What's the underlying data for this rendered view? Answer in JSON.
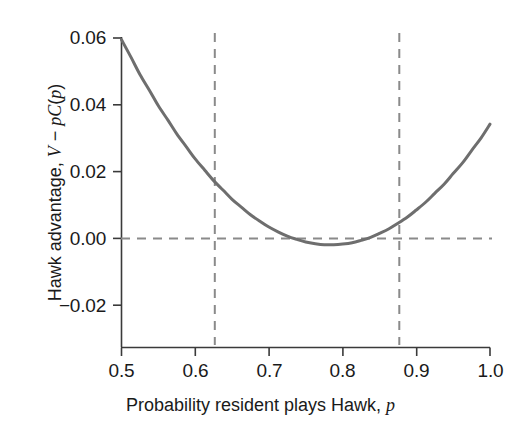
{
  "chart_data": {
    "type": "line",
    "title": "",
    "xlabel": "Probability resident plays Hawk, p",
    "ylabel": "Hawk advantage, V − pC(p)",
    "xlim": [
      0.5,
      1.0
    ],
    "ylim": [
      -0.0326,
      0.0606
    ],
    "grid": false,
    "legend": null,
    "xticks": [
      0.5,
      0.6,
      0.7,
      0.8,
      0.9,
      1.0
    ],
    "xticklabels": [
      "0.5",
      "0.6",
      "0.7",
      "0.8",
      "0.9",
      "1.0"
    ],
    "yticks": [
      -0.02,
      0.0,
      0.02,
      0.04,
      0.06
    ],
    "yticklabels": [
      "−0.02",
      "0.00",
      "0.02",
      "0.04",
      "0.06"
    ],
    "series": [
      {
        "name": "Hawk advantage",
        "color": "#6e6e6e",
        "linewidth": 3,
        "x": [
          0.5,
          0.513,
          0.525,
          0.538,
          0.55,
          0.563,
          0.575,
          0.588,
          0.6,
          0.613,
          0.625,
          0.638,
          0.65,
          0.663,
          0.675,
          0.688,
          0.7,
          0.713,
          0.725,
          0.738,
          0.75,
          0.763,
          0.775,
          0.788,
          0.8,
          0.813,
          0.825,
          0.838,
          0.85,
          0.863,
          0.875,
          0.888,
          0.9,
          0.913,
          0.925,
          0.938,
          0.95,
          0.963,
          0.975,
          0.988,
          1.0
        ],
        "y": [
          0.0595,
          0.0542,
          0.0491,
          0.0443,
          0.0397,
          0.0354,
          0.0313,
          0.0274,
          0.0238,
          0.0204,
          0.0173,
          0.0144,
          0.0117,
          0.0093,
          0.0071,
          0.0051,
          0.0034,
          0.0019,
          0.0007,
          -0.0003,
          -0.0011,
          -0.0016,
          -0.0019,
          -0.0019,
          -0.0017,
          -0.0013,
          -0.0006,
          0.0003,
          0.0015,
          0.0029,
          0.0045,
          0.0064,
          0.0085,
          0.0109,
          0.0135,
          0.0163,
          0.0194,
          0.0227,
          0.0263,
          0.0301,
          0.0342
        ]
      }
    ],
    "annotations": [
      {
        "type": "hline",
        "name": "zero-reference-line",
        "y": 0.0,
        "style": "dashed",
        "color": "#8a8a8a"
      },
      {
        "type": "vline",
        "name": "lower-equilibrium-line",
        "x": 0.625,
        "style": "dashed",
        "color": "#8a8a8a"
      },
      {
        "type": "vline",
        "name": "upper-equilibrium-line",
        "x": 0.875,
        "style": "dashed",
        "color": "#8a8a8a"
      }
    ],
    "notes": {
      "minimum_x": 0.735,
      "minimum_y": -0.0143,
      "left_endpoint_y": 0.0595,
      "right_endpoint_y": 0.0305,
      "zero_crossings": [
        0.625,
        0.875
      ]
    }
  },
  "axis_title_parts": {
    "y_prefix": "Hawk advantage, ",
    "y_V": "V",
    "y_minus": " − ",
    "y_p1": "p",
    "y_C": "C",
    "y_open": "(",
    "y_p2": "p",
    "y_close": ")",
    "x_prefix": "Probability resident plays Hawk, ",
    "x_p": "p"
  }
}
